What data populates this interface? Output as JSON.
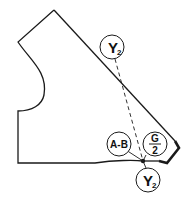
{
  "diagram": {
    "type": "sewing-pattern-piece",
    "stroke_color": "#1a1a1a",
    "background": "#ffffff",
    "labels": {
      "y2_top": {
        "main": "Y",
        "sub": "2"
      },
      "y2_bottom": {
        "main": "Y",
        "sub": "2"
      },
      "a_b": "A-B",
      "g_half": {
        "numerator": "G",
        "denominator": "2"
      }
    }
  }
}
